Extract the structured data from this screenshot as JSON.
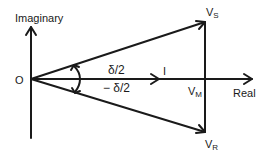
{
  "diagram": {
    "type": "phasor-diagram",
    "axes": {
      "vertical_label": "Imaginary",
      "horizontal_label": "Real",
      "origin_label": "O"
    },
    "phasors": {
      "vs": {
        "main": "V",
        "sub": "S"
      },
      "vr": {
        "main": "V",
        "sub": "R"
      },
      "vm": {
        "main": "V",
        "sub": "M"
      },
      "current": "I"
    },
    "angles": {
      "upper": "δ/2",
      "lower": "− δ/2"
    },
    "colors": {
      "stroke": "#1a1a1a",
      "background": "#ffffff"
    }
  }
}
